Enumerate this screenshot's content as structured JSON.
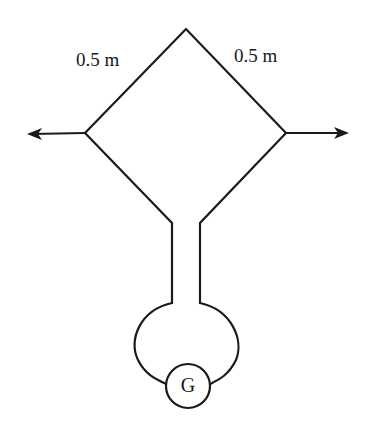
{
  "diagram": {
    "type": "circuit-loop",
    "labels": {
      "left_side_length": "0.5 m",
      "right_side_length": "0.5 m",
      "galvanometer": "G"
    },
    "arrows": [
      {
        "direction": "left",
        "name": "pull-left-arrow"
      },
      {
        "direction": "right",
        "name": "pull-right-arrow"
      }
    ],
    "colors": {
      "stroke": "#1a1a1a",
      "background": "#ffffff"
    }
  }
}
